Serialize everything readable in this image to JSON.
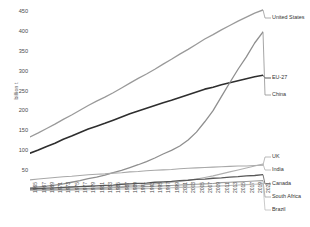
{
  "chart_data": {
    "type": "line",
    "title": "",
    "subtitle": "",
    "xlabel": "",
    "ylabel": "billion t",
    "ylim": [
      0,
      470
    ],
    "xlim": [
      1965,
      2021
    ],
    "yticks": [
      50,
      100,
      150,
      200,
      250,
      300,
      350,
      400,
      450
    ],
    "grid": false,
    "legend_position": "right-inline",
    "x": [
      1965,
      1967,
      1969,
      1971,
      1973,
      1975,
      1977,
      1979,
      1981,
      1983,
      1985,
      1987,
      1989,
      1991,
      1993,
      1995,
      1997,
      1999,
      2001,
      2003,
      2005,
      2007,
      2009,
      2011,
      2013,
      2015,
      2017,
      2019,
      2021
    ],
    "xticklabels": [
      "1965",
      "1967",
      "1969",
      "1971",
      "1973",
      "1975",
      "1977",
      "1979",
      "1981",
      "1983",
      "1985",
      "1987",
      "1989",
      "1991",
      "1993",
      "1995",
      "1997",
      "1999",
      "2001",
      "2003",
      "2005",
      "2007",
      "2009",
      "2011",
      "2013",
      "2015",
      "2017",
      "2019",
      "2021"
    ],
    "series": [
      {
        "name": "United States",
        "color": "#9a9a9a",
        "width": 1.3,
        "values": [
          136,
          146,
          157,
          168,
          180,
          191,
          203,
          215,
          226,
          236,
          247,
          259,
          271,
          283,
          294,
          306,
          319,
          331,
          344,
          356,
          369,
          382,
          393,
          405,
          416,
          427,
          437,
          447,
          455
        ]
      },
      {
        "name": "EU-27",
        "color": "#2e2e2e",
        "width": 1.6,
        "values": [
          95,
          103,
          112,
          120,
          130,
          138,
          147,
          156,
          163,
          170,
          178,
          186,
          194,
          201,
          208,
          215,
          222,
          228,
          235,
          242,
          249,
          256,
          261,
          267,
          272,
          277,
          282,
          287,
          291
        ]
      },
      {
        "name": "China",
        "color": "#8f8f8f",
        "width": 1.3,
        "values": [
          8,
          10,
          12,
          15,
          18,
          22,
          26,
          31,
          35,
          40,
          46,
          52,
          59,
          66,
          74,
          83,
          93,
          102,
          113,
          128,
          148,
          174,
          202,
          237,
          272,
          306,
          337,
          372,
          400
        ]
      },
      {
        "name": "UK",
        "color": "#a8a8a8",
        "width": 1.1,
        "values": [
          28,
          30,
          32,
          34,
          36,
          37,
          39,
          41,
          42,
          43,
          45,
          46,
          48,
          49,
          51,
          52,
          53,
          54,
          56,
          57,
          58,
          59,
          60,
          61,
          62,
          63,
          63,
          64,
          65
        ]
      },
      {
        "name": "India",
        "color": "#b0b0b0",
        "width": 1.1,
        "values": [
          2,
          3,
          3,
          4,
          5,
          5,
          6,
          7,
          8,
          9,
          10,
          11,
          13,
          14,
          16,
          18,
          20,
          22,
          24,
          27,
          30,
          34,
          38,
          43,
          48,
          53,
          58,
          63,
          68
        ]
      },
      {
        "name": "Canada",
        "color": "#585858",
        "width": 1.3,
        "values": [
          5,
          6,
          7,
          8,
          9,
          10,
          11,
          12,
          13,
          14,
          15,
          17,
          18,
          19,
          20,
          22,
          23,
          24,
          26,
          27,
          29,
          30,
          32,
          33,
          35,
          36,
          38,
          39,
          41
        ]
      },
      {
        "name": "South Africa",
        "color": "#9e9e9e",
        "width": 1.1,
        "values": [
          2,
          2,
          3,
          3,
          4,
          4,
          5,
          6,
          6,
          7,
          8,
          9,
          10,
          10,
          11,
          12,
          13,
          14,
          15,
          16,
          17,
          18,
          19,
          21,
          22,
          23,
          24,
          25,
          26
        ]
      },
      {
        "name": "Brazil",
        "color": "#bcbcbc",
        "width": 1.1,
        "values": [
          1,
          1,
          1,
          2,
          2,
          2,
          3,
          3,
          4,
          4,
          4,
          5,
          5,
          6,
          6,
          7,
          7,
          8,
          9,
          9,
          10,
          11,
          12,
          13,
          14,
          15,
          16,
          17,
          18
        ]
      }
    ],
    "legend_entries": [
      {
        "label": "United States",
        "y": 18
      },
      {
        "label": "EU-27",
        "y": 78
      },
      {
        "label": "China",
        "y": 95
      },
      {
        "label": "UK",
        "y": 157
      },
      {
        "label": "India",
        "y": 170
      },
      {
        "label": "Canada",
        "y": 184
      },
      {
        "label": "South Africa",
        "y": 197
      },
      {
        "label": "Brazil",
        "y": 210
      }
    ]
  }
}
